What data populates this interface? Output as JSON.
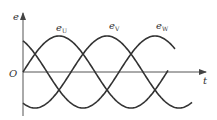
{
  "diagram": {
    "axes": {
      "y_label": "e",
      "x_label": "t",
      "origin_label": "O"
    },
    "curves": [
      {
        "name": "e_U",
        "label_main": "e",
        "label_sub": "U",
        "phase_deg": 0
      },
      {
        "name": "e_V",
        "label_main": "e",
        "label_sub": "V",
        "phase_deg": -120
      },
      {
        "name": "e_W",
        "label_main": "e",
        "label_sub": "W",
        "phase_deg": -240
      }
    ],
    "colors": {
      "line": "#333333",
      "background": "#ffffff"
    }
  }
}
